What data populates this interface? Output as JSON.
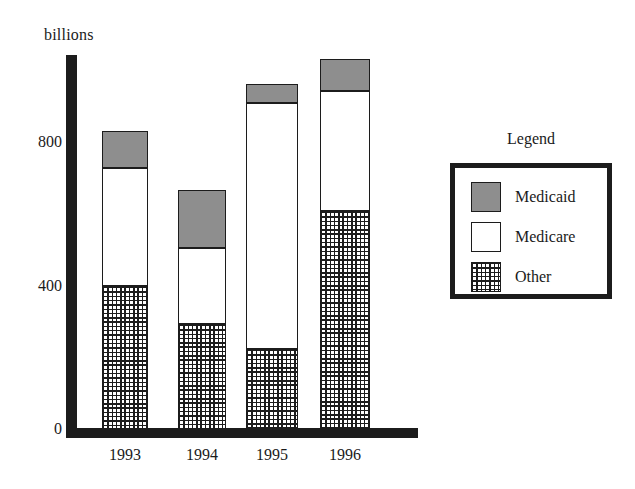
{
  "chart_data": {
    "type": "bar",
    "subtype": "stacked-bar",
    "title": "",
    "xlabel": "",
    "ylabel": "billions",
    "categories": [
      "1993",
      "1994",
      "1995",
      "1996"
    ],
    "series": [
      {
        "name": "Other",
        "values": [
          399,
          293,
          223,
          608
        ]
      },
      {
        "name": "Medicare",
        "values": [
          329,
          212,
          686,
          334
        ]
      },
      {
        "name": "Medicaid",
        "values": [
          103,
          161,
          53,
          89
        ]
      }
    ],
    "totals": [
      831,
      666,
      962,
      1031
    ],
    "stack_order_bottom_to_top": [
      "Other",
      "Medicare",
      "Medicaid"
    ],
    "ylim": [
      0,
      1060
    ],
    "yticks": [
      "0",
      "400",
      "800"
    ],
    "ytick_values": [
      0,
      400,
      800
    ],
    "grid": false,
    "legend": {
      "title": "Legend",
      "position": "right",
      "entries": [
        {
          "label": "Medicaid",
          "fill": "solid-gray",
          "color": "#8e8e8e"
        },
        {
          "label": "Medicare",
          "fill": "solid-white",
          "color": "#ffffff"
        },
        {
          "label": "Other",
          "fill": "crosshatch",
          "color": "#ffffff"
        }
      ]
    },
    "colors": {
      "axis": "#1c1c1c",
      "outline": "#1c1c1c",
      "background": "#ffffff",
      "medicaid": "#8e8e8e",
      "medicare": "#ffffff",
      "other": "#ffffff"
    }
  }
}
